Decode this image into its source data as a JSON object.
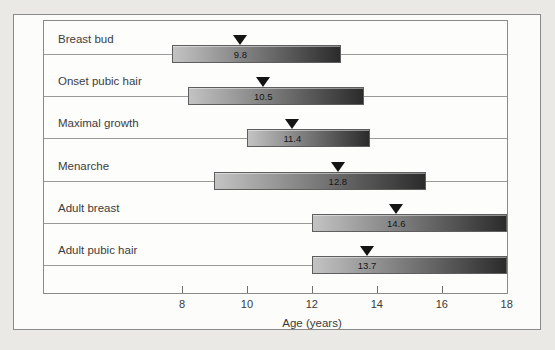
{
  "chart_data": {
    "type": "bar",
    "subtype": "horizontal-range-bars-timeline",
    "title": "",
    "xlabel": "Age (years)",
    "x_axis": {
      "unit": "years",
      "displayed_min": 8,
      "displayed_max": 18,
      "tick_marks": [
        8,
        10,
        12,
        14,
        16
      ],
      "tick_labels": [
        "8",
        "10",
        "12",
        "14",
        "16",
        "18"
      ],
      "tick_label_values": [
        8,
        10,
        12,
        14,
        16,
        18
      ]
    },
    "grid": "one horizontal line per row",
    "legend": "none",
    "rows": [
      {
        "label": "Breast bud",
        "start": 7.7,
        "end": 12.9,
        "mean": 9.8,
        "mean_label": "9.8"
      },
      {
        "label": "Onset pubic hair",
        "start": 8.2,
        "end": 13.6,
        "mean": 10.5,
        "mean_label": "10.5"
      },
      {
        "label": "Maximal growth",
        "start": 10.0,
        "end": 13.8,
        "mean": 11.4,
        "mean_label": "11.4"
      },
      {
        "label": "Menarche",
        "start": 9.0,
        "end": 15.5,
        "mean": 12.8,
        "mean_label": "12.8"
      },
      {
        "label": "Adult breast",
        "start": 12.0,
        "end": 18.0,
        "mean": 14.6,
        "mean_label": "14.6"
      },
      {
        "label": "Adult pubic hair",
        "start": 12.0,
        "end": 18.0,
        "mean": 13.7,
        "mean_label": "13.7"
      }
    ],
    "marker_glyph": "filled downward triangle above each bar at the mean age",
    "colors": {
      "page_bg": "#ebe9e5",
      "figure_bg": "#fcfcfa",
      "frame": "#8a8a8a",
      "row_line": "#9a9a9a",
      "text": "#3c3c3c",
      "bar_gradient_start": "#c3c3c3",
      "bar_gradient_end": "#2b2b2b",
      "marker": "#141414"
    }
  }
}
